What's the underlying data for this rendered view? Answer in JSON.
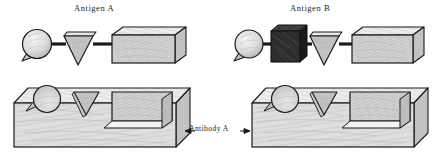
{
  "figure": {
    "kind": "scientific-line-illustration",
    "style": "pen-and-ink cross-hatched",
    "background_color": "#ffffff",
    "ink_color": "#1a1a1a",
    "fill_light": "#d9d9d9",
    "fill_mid": "#c2c2c2",
    "fill_dark": "#2a2a2a"
  },
  "labels": {
    "antigen_a": "Antigen A",
    "antigen_b": "Antigen B",
    "antibody_a": "Antibody A"
  },
  "panels": [
    {
      "id": "antigen-a",
      "title": "Antigen A",
      "position": "top-left",
      "shapes": [
        {
          "name": "sphere-with-spike",
          "order": 1,
          "fill": "#e0e0e0"
        },
        {
          "name": "inverted-triangle",
          "order": 2,
          "fill": "#cfcfcf"
        },
        {
          "name": "rectangular-block",
          "order": 3,
          "fill": "#d6d6d6"
        }
      ],
      "connectors": 2
    },
    {
      "id": "antigen-b",
      "title": "Antigen B",
      "position": "top-right",
      "shapes": [
        {
          "name": "sphere-with-spike",
          "order": 1,
          "fill": "#e0e0e0"
        },
        {
          "name": "dark-cube",
          "order": 2,
          "fill": "#2a2a2a"
        },
        {
          "name": "inverted-triangle",
          "order": 3,
          "fill": "#cfcfcf"
        },
        {
          "name": "rectangular-block",
          "order": 4,
          "fill": "#d6d6d6"
        }
      ],
      "connectors": 3
    },
    {
      "id": "antibody-a-left",
      "title": "Antibody A",
      "position": "bottom-left",
      "cavities": [
        {
          "name": "sphere-cavity",
          "order": 1
        },
        {
          "name": "triangle-cavity",
          "order": 2
        },
        {
          "name": "rectangular-cavity",
          "order": 3
        }
      ]
    },
    {
      "id": "antibody-a-right",
      "title": "Antibody A",
      "position": "bottom-right",
      "cavities": [
        {
          "name": "sphere-cavity",
          "order": 1
        },
        {
          "name": "triangle-cavity",
          "order": 2
        },
        {
          "name": "rectangular-cavity",
          "order": 3
        }
      ]
    }
  ],
  "annotation": {
    "text": "Antibody A",
    "arrow_left": "←",
    "arrow_right": "→",
    "points_to": [
      "antibody-a-left",
      "antibody-a-right"
    ]
  }
}
